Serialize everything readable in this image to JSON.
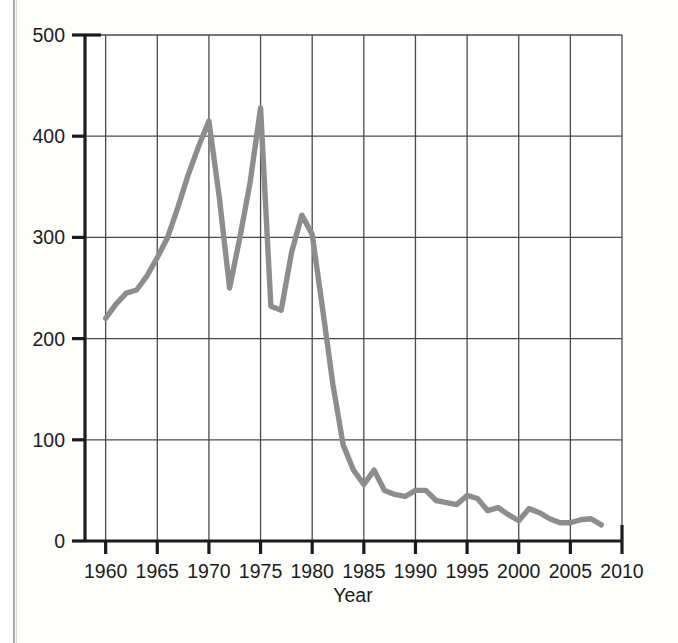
{
  "figure": {
    "background_color": "#fdfdfc",
    "line_color": "#8d8d8d",
    "axis_color": "#1b1b1b",
    "grid_color": "#4a4a4a"
  },
  "chart_data": {
    "type": "line",
    "title": "",
    "xlabel": "Year",
    "ylabel": "",
    "xlim": [
      1958,
      2010
    ],
    "ylim": [
      0,
      500
    ],
    "xticks": [
      1960,
      1965,
      1970,
      1975,
      1980,
      1985,
      1990,
      1995,
      2000,
      2005,
      2010
    ],
    "yticks": [
      0,
      100,
      200,
      300,
      400,
      500
    ],
    "xtick_labels": [
      "1960",
      "1965",
      "1970",
      "1975",
      "1980",
      "1985",
      "1990",
      "1995",
      "2000",
      "2005",
      "2010"
    ],
    "ytick_labels": [
      "0",
      "100",
      "200",
      "300",
      "400",
      "500"
    ],
    "grid": true,
    "grid_axis": "both",
    "legend": false,
    "series": [
      {
        "name": "series-1",
        "color": "#8d8d8d",
        "x": [
          1960,
          1961,
          1962,
          1963,
          1964,
          1965,
          1966,
          1967,
          1968,
          1969,
          1970,
          1971,
          1972,
          1973,
          1974,
          1975,
          1976,
          1977,
          1978,
          1979,
          1980,
          1981,
          1982,
          1983,
          1984,
          1985,
          1986,
          1987,
          1988,
          1989,
          1990,
          1991,
          1992,
          1993,
          1994,
          1995,
          1996,
          1997,
          1998,
          1999,
          2000,
          2001,
          2002,
          2003,
          2004,
          2005,
          2006,
          2007,
          2008
        ],
        "y": [
          220,
          234,
          245,
          248,
          262,
          280,
          300,
          330,
          362,
          390,
          415,
          340,
          250,
          300,
          355,
          428,
          232,
          228,
          285,
          322,
          303,
          230,
          155,
          95,
          70,
          56,
          70,
          50,
          46,
          44,
          50,
          50,
          40,
          38,
          36,
          45,
          42,
          30,
          33,
          26,
          20,
          32,
          28,
          22,
          18,
          18,
          21,
          22,
          16
        ]
      }
    ]
  },
  "axis_title": {
    "x": "Year"
  }
}
